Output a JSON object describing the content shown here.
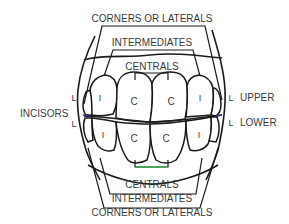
{
  "diagram": {
    "top_labels": {
      "corners": "CORNERS OR LATERALS",
      "intermediates": "INTERMEDIATES",
      "centrals": "CENTRALS"
    },
    "bottom_labels": {
      "centrals": "CENTRALS",
      "intermediates": "INTERMEDIATES",
      "corners": "CORNERS OR LATERALS"
    },
    "side_labels": {
      "incisors": "INCISORS",
      "upper": "UPPER",
      "lower": "LOWER"
    },
    "tooth_codes": {
      "corner": "L",
      "intermediate": "I",
      "central": "C"
    },
    "colors": {
      "line": "#1a1a1a",
      "text": "#3a3a3a",
      "green_accent": "#3aa84a",
      "blue_accent": "#2a2a9a"
    }
  }
}
